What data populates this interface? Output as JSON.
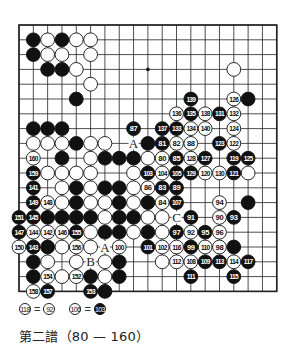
{
  "diagram": {
    "type": "go-kifu",
    "board_size": 19,
    "visible_columns": 19,
    "visible_rows": 19,
    "star_points": [
      [
        9,
        3
      ]
    ],
    "colors": {
      "black": "#111111",
      "white": "#ffffff",
      "line": "#222222"
    },
    "stones": [
      {
        "c": 1,
        "r": 1,
        "color": "B"
      },
      {
        "c": 2,
        "r": 1,
        "color": "W"
      },
      {
        "c": 3,
        "r": 1,
        "color": "B"
      },
      {
        "c": 4,
        "r": 1,
        "color": "W"
      },
      {
        "c": 5,
        "r": 1,
        "color": "W"
      },
      {
        "c": 1,
        "r": 2,
        "color": "B"
      },
      {
        "c": 2,
        "r": 2,
        "color": "W"
      },
      {
        "c": 3,
        "r": 2,
        "color": "W"
      },
      {
        "c": 5,
        "r": 2,
        "color": "W"
      },
      {
        "c": 2,
        "r": 3,
        "color": "B"
      },
      {
        "c": 3,
        "r": 3,
        "color": "B"
      },
      {
        "c": 4,
        "r": 3,
        "color": "W"
      },
      {
        "c": 15,
        "r": 3,
        "color": "W"
      },
      {
        "c": 5,
        "r": 4,
        "color": "W"
      },
      {
        "c": 4,
        "r": 5,
        "color": "B"
      },
      {
        "c": 12,
        "r": 5,
        "color": "B",
        "n": "139"
      },
      {
        "c": 15,
        "r": 5,
        "color": "W",
        "n": "126"
      },
      {
        "c": 16,
        "r": 5,
        "color": "B"
      },
      {
        "c": 11,
        "r": 6,
        "color": "W",
        "n": "136"
      },
      {
        "c": 12,
        "r": 6,
        "color": "B",
        "n": "135"
      },
      {
        "c": 13,
        "r": 6,
        "color": "W",
        "n": "138"
      },
      {
        "c": 14,
        "r": 6,
        "color": "B",
        "n": "131"
      },
      {
        "c": 15,
        "r": 6,
        "color": "W",
        "n": "132"
      },
      {
        "c": 1,
        "r": 7,
        "color": "B"
      },
      {
        "c": 2,
        "r": 7,
        "color": "B"
      },
      {
        "c": 3,
        "r": 7,
        "color": "B"
      },
      {
        "c": 8,
        "r": 7,
        "color": "B",
        "n": "87"
      },
      {
        "c": 10,
        "r": 7,
        "color": "B",
        "n": "137"
      },
      {
        "c": 11,
        "r": 7,
        "color": "B",
        "n": "133"
      },
      {
        "c": 12,
        "r": 7,
        "color": "W",
        "n": "134"
      },
      {
        "c": 13,
        "r": 7,
        "color": "W",
        "n": "140"
      },
      {
        "c": 15,
        "r": 7,
        "color": "W",
        "n": "124"
      },
      {
        "c": 1,
        "r": 8,
        "color": "W"
      },
      {
        "c": 2,
        "r": 8,
        "color": "W"
      },
      {
        "c": 3,
        "r": 8,
        "color": "W"
      },
      {
        "c": 4,
        "r": 8,
        "color": "B"
      },
      {
        "c": 5,
        "r": 8,
        "color": "W"
      },
      {
        "c": 6,
        "r": 8,
        "color": "W"
      },
      {
        "c": 9,
        "r": 8,
        "color": "B"
      },
      {
        "c": 10,
        "r": 8,
        "color": "B",
        "n": "81"
      },
      {
        "c": 11,
        "r": 8,
        "color": "W",
        "n": "82"
      },
      {
        "c": 12,
        "r": 8,
        "color": "W",
        "n": "88"
      },
      {
        "c": 14,
        "r": 8,
        "color": "B",
        "n": "123"
      },
      {
        "c": 15,
        "r": 8,
        "color": "W",
        "n": "122"
      },
      {
        "c": 1,
        "r": 9,
        "color": "W",
        "n": "160"
      },
      {
        "c": 3,
        "r": 9,
        "color": "B"
      },
      {
        "c": 5,
        "r": 9,
        "color": "W"
      },
      {
        "c": 6,
        "r": 9,
        "color": "B"
      },
      {
        "c": 7,
        "r": 9,
        "color": "B"
      },
      {
        "c": 8,
        "r": 9,
        "color": "B"
      },
      {
        "c": 9,
        "r": 9,
        "color": "W"
      },
      {
        "c": 10,
        "r": 9,
        "color": "W",
        "n": "80"
      },
      {
        "c": 11,
        "r": 9,
        "color": "B",
        "n": "85"
      },
      {
        "c": 12,
        "r": 9,
        "color": "W",
        "n": "128"
      },
      {
        "c": 13,
        "r": 9,
        "color": "B",
        "n": "127"
      },
      {
        "c": 15,
        "r": 9,
        "color": "B",
        "n": "119"
      },
      {
        "c": 16,
        "r": 9,
        "color": "B",
        "n": "125"
      },
      {
        "c": 1,
        "r": 10,
        "color": "B",
        "n": "159"
      },
      {
        "c": 2,
        "r": 10,
        "color": "W"
      },
      {
        "c": 3,
        "r": 10,
        "color": "W"
      },
      {
        "c": 4,
        "r": 10,
        "color": "W"
      },
      {
        "c": 5,
        "r": 10,
        "color": "W"
      },
      {
        "c": 8,
        "r": 10,
        "color": "W"
      },
      {
        "c": 9,
        "r": 10,
        "color": "B",
        "n": "103"
      },
      {
        "c": 10,
        "r": 10,
        "color": "W",
        "n": "104"
      },
      {
        "c": 11,
        "r": 10,
        "color": "B",
        "n": "105"
      },
      {
        "c": 12,
        "r": 10,
        "color": "B",
        "n": "129"
      },
      {
        "c": 13,
        "r": 10,
        "color": "W",
        "n": "120"
      },
      {
        "c": 14,
        "r": 10,
        "color": "W",
        "n": "130"
      },
      {
        "c": 15,
        "r": 10,
        "color": "B",
        "n": "121"
      },
      {
        "c": 16,
        "r": 10,
        "color": "W"
      },
      {
        "c": 1,
        "r": 11,
        "color": "B",
        "n": "141"
      },
      {
        "c": 3,
        "r": 11,
        "color": "W"
      },
      {
        "c": 4,
        "r": 11,
        "color": "B"
      },
      {
        "c": 5,
        "r": 11,
        "color": "W"
      },
      {
        "c": 6,
        "r": 11,
        "color": "B"
      },
      {
        "c": 7,
        "r": 11,
        "color": "B"
      },
      {
        "c": 8,
        "r": 11,
        "color": "W"
      },
      {
        "c": 9,
        "r": 11,
        "color": "W",
        "n": "86"
      },
      {
        "c": 10,
        "r": 11,
        "color": "B",
        "n": "83"
      },
      {
        "c": 11,
        "r": 11,
        "color": "B",
        "n": "89"
      },
      {
        "c": 1,
        "r": 12,
        "color": "B",
        "n": "149"
      },
      {
        "c": 2,
        "r": 12,
        "color": "W",
        "n": "148"
      },
      {
        "c": 3,
        "r": 12,
        "color": "W"
      },
      {
        "c": 4,
        "r": 12,
        "color": "B"
      },
      {
        "c": 5,
        "r": 12,
        "color": "W"
      },
      {
        "c": 6,
        "r": 12,
        "color": "W"
      },
      {
        "c": 7,
        "r": 12,
        "color": "B"
      },
      {
        "c": 8,
        "r": 12,
        "color": "W"
      },
      {
        "c": 9,
        "r": 12,
        "color": "B"
      },
      {
        "c": 10,
        "r": 12,
        "color": "W",
        "n": "84"
      },
      {
        "c": 11,
        "r": 12,
        "color": "B",
        "n": "107"
      },
      {
        "c": 14,
        "r": 12,
        "color": "W",
        "n": "94"
      },
      {
        "c": 16,
        "r": 12,
        "color": "B"
      },
      {
        "c": 0,
        "r": 13,
        "color": "B",
        "n": "151"
      },
      {
        "c": 1,
        "r": 13,
        "color": "B",
        "n": "145"
      },
      {
        "c": 2,
        "r": 13,
        "color": "B"
      },
      {
        "c": 3,
        "r": 13,
        "color": "B"
      },
      {
        "c": 4,
        "r": 13,
        "color": "B"
      },
      {
        "c": 5,
        "r": 13,
        "color": "B"
      },
      {
        "c": 6,
        "r": 13,
        "color": "W"
      },
      {
        "c": 7,
        "r": 13,
        "color": "B"
      },
      {
        "c": 8,
        "r": 13,
        "color": "B"
      },
      {
        "c": 9,
        "r": 13,
        "color": "W"
      },
      {
        "c": 10,
        "r": 13,
        "color": "W"
      },
      {
        "c": 12,
        "r": 13,
        "color": "B",
        "n": "91"
      },
      {
        "c": 14,
        "r": 13,
        "color": "W",
        "n": "90"
      },
      {
        "c": 15,
        "r": 13,
        "color": "B",
        "n": "93"
      },
      {
        "c": 0,
        "r": 14,
        "color": "B",
        "n": "147"
      },
      {
        "c": 1,
        "r": 14,
        "color": "W",
        "n": "144"
      },
      {
        "c": 2,
        "r": 14,
        "color": "W",
        "n": "142"
      },
      {
        "c": 3,
        "r": 14,
        "color": "W",
        "n": "146"
      },
      {
        "c": 4,
        "r": 14,
        "color": "B",
        "n": "155"
      },
      {
        "c": 5,
        "r": 14,
        "color": "W"
      },
      {
        "c": 6,
        "r": 14,
        "color": "B"
      },
      {
        "c": 7,
        "r": 14,
        "color": "B"
      },
      {
        "c": 8,
        "r": 14,
        "color": "W"
      },
      {
        "c": 9,
        "r": 14,
        "color": "B"
      },
      {
        "c": 10,
        "r": 14,
        "color": "W"
      },
      {
        "c": 11,
        "r": 14,
        "color": "B",
        "n": "97"
      },
      {
        "c": 12,
        "r": 14,
        "color": "W",
        "n": "92"
      },
      {
        "c": 13,
        "r": 14,
        "color": "B",
        "n": "95"
      },
      {
        "c": 14,
        "r": 14,
        "color": "W",
        "n": "96"
      },
      {
        "c": 0,
        "r": 15,
        "color": "W",
        "n": "150"
      },
      {
        "c": 1,
        "r": 15,
        "color": "B",
        "n": "143"
      },
      {
        "c": 2,
        "r": 15,
        "color": "B"
      },
      {
        "c": 3,
        "r": 15,
        "color": "W"
      },
      {
        "c": 4,
        "r": 15,
        "color": "W",
        "n": "156"
      },
      {
        "c": 5,
        "r": 15,
        "color": "W"
      },
      {
        "c": 7,
        "r": 15,
        "color": "W",
        "n": "100"
      },
      {
        "c": 9,
        "r": 15,
        "color": "B",
        "n": "101"
      },
      {
        "c": 10,
        "r": 15,
        "color": "W",
        "n": "102"
      },
      {
        "c": 11,
        "r": 15,
        "color": "W",
        "n": "116"
      },
      {
        "c": 12,
        "r": 15,
        "color": "B",
        "n": "99"
      },
      {
        "c": 13,
        "r": 15,
        "color": "W",
        "n": "110"
      },
      {
        "c": 14,
        "r": 15,
        "color": "W",
        "n": "98"
      },
      {
        "c": 15,
        "r": 15,
        "color": "B"
      },
      {
        "c": 1,
        "r": 16,
        "color": "B"
      },
      {
        "c": 2,
        "r": 16,
        "color": "W"
      },
      {
        "c": 4,
        "r": 16,
        "color": "W"
      },
      {
        "c": 6,
        "r": 16,
        "color": "W"
      },
      {
        "c": 7,
        "r": 16,
        "color": "B"
      },
      {
        "c": 10,
        "r": 16,
        "color": "W"
      },
      {
        "c": 11,
        "r": 16,
        "color": "W",
        "n": "112"
      },
      {
        "c": 12,
        "r": 16,
        "color": "W",
        "n": "108"
      },
      {
        "c": 13,
        "r": 16,
        "color": "B",
        "n": "109"
      },
      {
        "c": 14,
        "r": 16,
        "color": "B",
        "n": "113"
      },
      {
        "c": 15,
        "r": 16,
        "color": "W",
        "n": "114"
      },
      {
        "c": 16,
        "r": 16,
        "color": "B",
        "n": "117"
      },
      {
        "c": 1,
        "r": 17,
        "color": "B"
      },
      {
        "c": 2,
        "r": 17,
        "color": "W",
        "n": "154"
      },
      {
        "c": 3,
        "r": 17,
        "color": "W"
      },
      {
        "c": 4,
        "r": 17,
        "color": "W",
        "n": "152"
      },
      {
        "c": 5,
        "r": 17,
        "color": "B"
      },
      {
        "c": 6,
        "r": 17,
        "color": "W"
      },
      {
        "c": 7,
        "r": 17,
        "color": "B"
      },
      {
        "c": 12,
        "r": 17,
        "color": "B",
        "n": "111"
      },
      {
        "c": 15,
        "r": 17,
        "color": "B",
        "n": "115"
      },
      {
        "c": 1,
        "r": 18,
        "color": "W",
        "n": "158"
      },
      {
        "c": 2,
        "r": 18,
        "color": "B",
        "n": "157"
      },
      {
        "c": 5,
        "r": 18,
        "color": "B",
        "n": "153"
      },
      {
        "c": 6,
        "r": 18,
        "color": "B"
      }
    ],
    "labels": [
      {
        "c": 8,
        "r": 8,
        "text": "A"
      },
      {
        "c": 6,
        "r": 15,
        "text": "A"
      },
      {
        "c": 5,
        "r": 16,
        "text": "B"
      },
      {
        "c": 11,
        "r": 13,
        "text": "C"
      }
    ]
  },
  "notes": [
    {
      "left": {
        "n": "118",
        "color": "W"
      },
      "eq": "=",
      "right": {
        "n": "92",
        "color": "W"
      }
    },
    {
      "left": {
        "n": "106",
        "color": "W"
      },
      "eq": "=",
      "right": {
        "n": "103",
        "color": "B"
      }
    }
  ],
  "caption": "第二譜（80 — 160）"
}
